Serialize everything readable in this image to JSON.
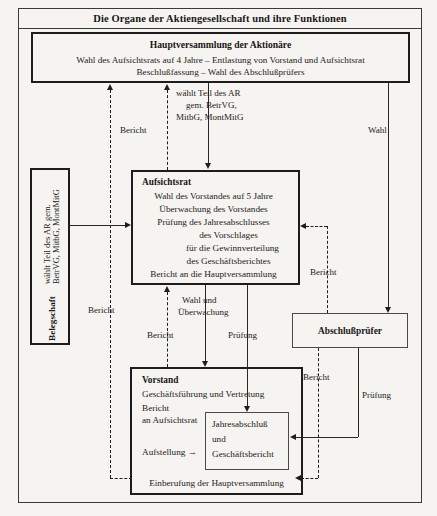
{
  "diagram": {
    "title": "Die Organe der Aktiengesellschaft und ihre Funktionen"
  },
  "nodes": {
    "hauptversammlung": {
      "title": "Hauptversammlung der Aktionäre",
      "line1": "Wahl des Aufsichtsrats auf 4 Jahre – Entlastung von Vorstand und Aufsichtsrat",
      "line2": "Beschlußfassung – Wahl des Abschlußprüfers"
    },
    "aufsichtsrat": {
      "title": "Aufsichtsrat",
      "lines": [
        "Wahl des Vorstandes auf 5 Jahre",
        "Überwachung des Vorstandes",
        "Prüfung des Jahresabschlusses",
        "des Vorschlages",
        "für die Gewinnverteilung",
        "des Geschäftsberichtes",
        "Bericht an die Hauptversammlung"
      ]
    },
    "vorstand": {
      "title": "Vorstand",
      "line1": "Geschäftsführung und Vertretung",
      "line2": "Bericht",
      "line3": "an Aufsichtsrat",
      "line4": "Aufstellung →",
      "bottom": "Einberufung der Hauptversammlung"
    },
    "jahresabschluss": {
      "line1": "Jahresabschluß",
      "line2": "und",
      "line3": "Geschäftsbericht"
    },
    "abschlusspruefer": {
      "title": "Abschlußprüfer"
    },
    "belegschaft": {
      "title": "Belegschaft",
      "line1": "wählt Teil des AR gem.",
      "line2": "BetrVG, MitbG, MontMitG"
    }
  },
  "edges": {
    "waehlt_teil_ar": {
      "line1": "wählt Teil des AR",
      "line2": "gem. BetrVG,",
      "line3": "MitbG, MontMitG"
    },
    "bericht_left": "Bericht",
    "bericht_hv": "Bericht",
    "bericht_ar": "Bericht",
    "bericht_ap_top": "Bericht",
    "bericht_ap_bottom": "Bericht",
    "wahl": "Wahl",
    "wahl_ueberwachung_1": "Wahl und",
    "wahl_ueberwachung_2": "Überwachung",
    "pruefung_ar": "Prüfung",
    "pruefung_ap": "Prüfung"
  },
  "colors": {
    "background": "#f6f4f0",
    "stroke": "#1d1d1d",
    "text": "#222222"
  }
}
